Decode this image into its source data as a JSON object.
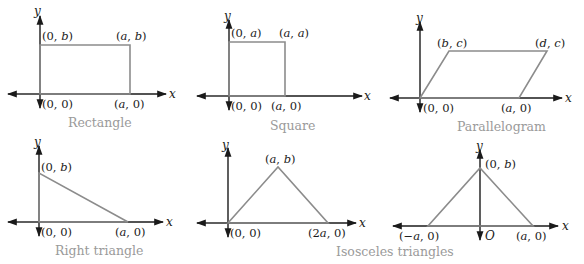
{
  "figure": {
    "panels": [
      {
        "name": "rectangle",
        "caption": "Rectangle",
        "x_axis_label": "x",
        "y_axis_label": "y",
        "vertices": [
          {
            "label": "(0, 0)"
          },
          {
            "label": "(a, 0)"
          },
          {
            "label": "(a, b)"
          },
          {
            "label": "(0, b)"
          }
        ]
      },
      {
        "name": "square",
        "caption": "Square",
        "x_axis_label": "x",
        "y_axis_label": "y",
        "vertices": [
          {
            "label": "(0, 0)"
          },
          {
            "label": "(a, 0)"
          },
          {
            "label": "(a, a)"
          },
          {
            "label": "(0, a)"
          }
        ]
      },
      {
        "name": "parallelogram",
        "caption": "Parallelogram",
        "x_axis_label": "x",
        "y_axis_label": "y",
        "vertices": [
          {
            "label": "(0, 0)"
          },
          {
            "label": "(a, 0)"
          },
          {
            "label": "(d, c)"
          },
          {
            "label": "(b, c)"
          }
        ]
      },
      {
        "name": "right-triangle",
        "caption": "Right triangle",
        "x_axis_label": "x",
        "y_axis_label": "y",
        "vertices": [
          {
            "label": "(0, 0)"
          },
          {
            "label": "(a, 0)"
          },
          {
            "label": "(0, b)"
          }
        ]
      },
      {
        "name": "isosceles-triangle-1",
        "x_axis_label": "x",
        "y_axis_label": "y",
        "vertices": [
          {
            "label": "(0, 0)"
          },
          {
            "label": "(2a, 0)"
          },
          {
            "label": "(a, b)"
          }
        ]
      },
      {
        "name": "isosceles-triangle-2",
        "x_axis_label": "x",
        "y_axis_label": "y",
        "origin_label": "O",
        "vertices": [
          {
            "label": "(−a, 0)"
          },
          {
            "label": "(a, 0)"
          },
          {
            "label": "(0, b)"
          }
        ]
      }
    ],
    "shared_caption": "Isosceles triangles"
  }
}
